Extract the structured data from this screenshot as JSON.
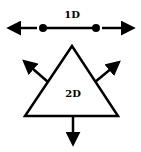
{
  "diagram": {
    "stroke_color": "#000000",
    "background": "#ffffff",
    "one_d": {
      "label": "1D",
      "segment": {
        "x1": 43,
        "y1": 28,
        "x2": 96,
        "y2": 28
      },
      "endpoints": [
        {
          "x": 43,
          "y": 28
        },
        {
          "x": 96,
          "y": 28
        }
      ],
      "arrows": [
        {
          "direction": "left",
          "from": {
            "x": 37,
            "y": 28
          },
          "to": {
            "x": 10,
            "y": 28
          }
        },
        {
          "direction": "right",
          "from": {
            "x": 102,
            "y": 28
          },
          "to": {
            "x": 132,
            "y": 28
          }
        }
      ]
    },
    "two_d": {
      "label": "2D",
      "triangle": [
        {
          "x": 72,
          "y": 46
        },
        {
          "x": 25,
          "y": 116
        },
        {
          "x": 118,
          "y": 116
        }
      ],
      "arrows": [
        {
          "direction": "up-left",
          "from": {
            "x": 48,
            "y": 82
          },
          "to": {
            "x": 25,
            "y": 62
          }
        },
        {
          "direction": "up-right",
          "from": {
            "x": 95,
            "y": 82
          },
          "to": {
            "x": 118,
            "y": 63
          }
        },
        {
          "direction": "down",
          "from": {
            "x": 73,
            "y": 116
          },
          "to": {
            "x": 73,
            "y": 143
          }
        }
      ]
    }
  }
}
